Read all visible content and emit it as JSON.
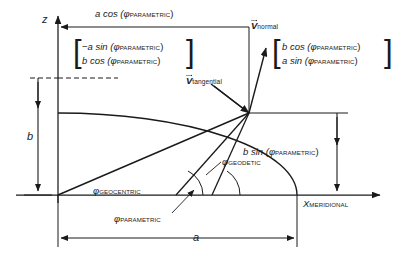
{
  "figure": {
    "type": "geometry-diagram"
  },
  "axes": {
    "z_axis_label": "z",
    "x_axis_label_main": "X",
    "x_axis_label_sub": "MERIDIONAL"
  },
  "dimensions": {
    "semi_minor": "b",
    "semi_major": "a",
    "top_span_prefix": "a cos (",
    "top_span_phi": "φ",
    "top_span_sub": "PARAMETRIC",
    "top_span_suffix": ")",
    "right_span_prefix": "b sin (",
    "right_span_phi": "φ",
    "right_span_sub": "PARAMETRIC",
    "right_span_suffix": ")"
  },
  "vectors": {
    "tangential": {
      "name": "V",
      "sub": "tangential",
      "matrix": [
        {
          "prefix": "−a sin (",
          "phi": "φ",
          "sub": "PARAMETRIC",
          "suffix": ")"
        },
        {
          "prefix": "b cos (",
          "phi": "φ",
          "sub": "PARAMETRIC",
          "suffix": ")"
        }
      ]
    },
    "normal": {
      "name": "V",
      "sub": "normal",
      "matrix": [
        {
          "prefix": "b cos (",
          "phi": "φ",
          "sub": "PARAMETRIC",
          "suffix": ")"
        },
        {
          "prefix": "a sin (",
          "phi": "φ",
          "sub": "PARAMETRIC",
          "suffix": ")"
        }
      ]
    }
  },
  "angles": [
    {
      "id": "geocentric",
      "phi": "φ",
      "sub": "GEOCENTRIC"
    },
    {
      "id": "parametric",
      "phi": "φ",
      "sub": "PARAMETRIC"
    },
    {
      "id": "geodetic",
      "phi": "φ",
      "sub": "GEODETIC"
    }
  ],
  "colors": {
    "ink": "#1a1a1a",
    "line": "#222222",
    "background": "#ffffff"
  }
}
